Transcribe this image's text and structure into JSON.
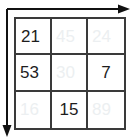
{
  "figure": {
    "type": "grid-table",
    "rows": 3,
    "cols": 3,
    "colors": {
      "grid_line": "#3a3a3a",
      "value_dark": "#1d1d1d",
      "value_faded": "#eceff1",
      "axis": "#111111",
      "background": "#ffffff"
    }
  },
  "axes": {
    "horizontal": {
      "name": "top-axis-arrow",
      "direction": "right"
    },
    "vertical": {
      "name": "left-axis-arrow",
      "direction": "down"
    }
  },
  "grid": {
    "cells": [
      [
        {
          "value": "21",
          "state": "dark"
        },
        {
          "value": "45",
          "state": "faded"
        },
        {
          "value": "24",
          "state": "faded"
        }
      ],
      [
        {
          "value": "53",
          "state": "dark"
        },
        {
          "value": "30",
          "state": "faded"
        },
        {
          "value": "7",
          "state": "dark"
        }
      ],
      [
        {
          "value": "16",
          "state": "faded"
        },
        {
          "value": "15",
          "state": "dark"
        },
        {
          "value": "89",
          "state": "faded"
        }
      ]
    ]
  }
}
